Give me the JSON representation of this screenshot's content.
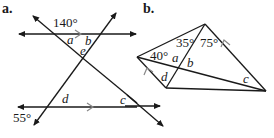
{
  "figure_a": {
    "label": "a.",
    "angles": {
      "top": "140°",
      "bottom": "55°"
    },
    "vars": {
      "a": "a",
      "b": "b",
      "e": "e",
      "d": "d",
      "c": "c"
    }
  },
  "figure_b": {
    "label": "b.",
    "angles": {
      "left": "40°",
      "top_left": "35°",
      "top_right": "75°"
    },
    "vars": {
      "a": "a",
      "b": "b",
      "d": "d",
      "c": "c"
    }
  },
  "colors": {
    "line": "#1a1a1a",
    "marker": "#888888",
    "background": "#ffffff"
  }
}
